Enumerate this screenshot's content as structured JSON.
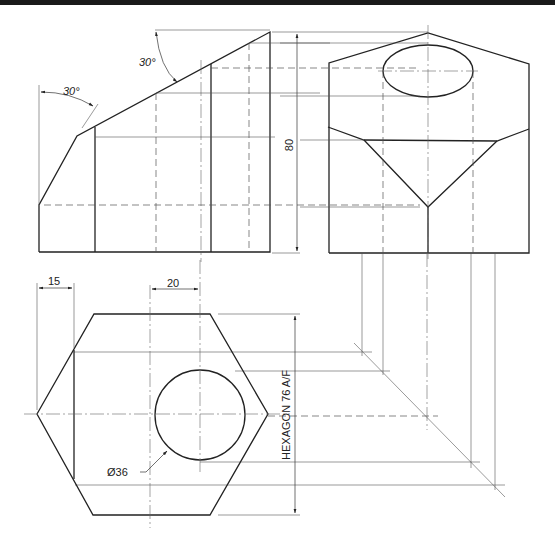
{
  "drawing": {
    "type": "orthographic projection",
    "views": [
      "front-elevation",
      "end-elevation",
      "plan"
    ]
  },
  "dimensions": {
    "angle_upper": "30°",
    "angle_left": "30°",
    "height": "80",
    "offset_left": "15",
    "offset_hole": "20",
    "hole_diameter": "Ø36",
    "hexagon": "HEXAGON 76 A/F"
  },
  "colors": {
    "line": "#222222",
    "background": "#ffffff",
    "topbar": "#1a1a1a"
  }
}
